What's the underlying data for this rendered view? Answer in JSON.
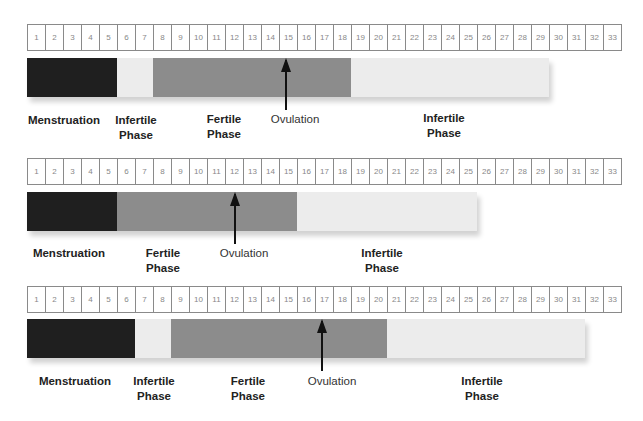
{
  "colors": {
    "menstruation": "#1f1f1f",
    "fertile": "#8c8c8c",
    "infertile": "#ececec",
    "arrow": "#111111"
  },
  "day_labels": [
    "1",
    "2",
    "3",
    "4",
    "5",
    "6",
    "7",
    "8",
    "9",
    "10",
    "11",
    "12",
    "13",
    "14",
    "15",
    "16",
    "17",
    "18",
    "19",
    "20",
    "21",
    "22",
    "23",
    "24",
    "25",
    "26",
    "27",
    "28",
    "29",
    "30",
    "31",
    "32",
    "33"
  ],
  "charts": [
    {
      "cycle_days": 29,
      "ovulation_day": 15,
      "segments": [
        {
          "phase": "menstruation",
          "start": 1,
          "end": 5
        },
        {
          "phase": "infertile",
          "start": 6,
          "end": 7
        },
        {
          "phase": "fertile",
          "start": 8,
          "end": 18
        },
        {
          "phase": "infertile",
          "start": 19,
          "end": 29
        }
      ],
      "labels": {
        "menstruation": "Menstruation",
        "infertile_pre_1": "Infertile",
        "infertile_pre_2": "Phase",
        "fertile_1": "Fertile",
        "fertile_2": "Phase",
        "ovulation": "Ovulation",
        "infertile_post_1": "Infertile",
        "infertile_post_2": "Phase"
      }
    },
    {
      "cycle_days": 25,
      "ovulation_day": 12,
      "segments": [
        {
          "phase": "menstruation",
          "start": 1,
          "end": 5
        },
        {
          "phase": "fertile",
          "start": 6,
          "end": 15
        },
        {
          "phase": "infertile",
          "start": 16,
          "end": 25
        }
      ],
      "labels": {
        "menstruation": "Menstruation",
        "fertile_1": "Fertile",
        "fertile_2": "Phase",
        "ovulation": "Ovulation",
        "infertile_post_1": "Infertile",
        "infertile_post_2": "Phase"
      }
    },
    {
      "cycle_days": 31,
      "ovulation_day": 17,
      "segments": [
        {
          "phase": "menstruation",
          "start": 1,
          "end": 6
        },
        {
          "phase": "infertile",
          "start": 7,
          "end": 8
        },
        {
          "phase": "fertile",
          "start": 9,
          "end": 20
        },
        {
          "phase": "infertile",
          "start": 21,
          "end": 31
        }
      ],
      "labels": {
        "menstruation": "Menstruation",
        "infertile_pre_1": "Infertile",
        "infertile_pre_2": "Phase",
        "fertile_1": "Fertile",
        "fertile_2": "Phase",
        "ovulation": "Ovulation",
        "infertile_post_1": "Infertile",
        "infertile_post_2": "Phase"
      }
    }
  ]
}
